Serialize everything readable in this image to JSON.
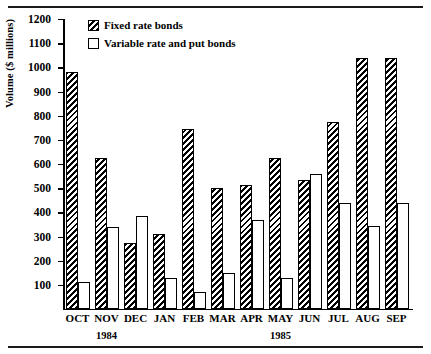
{
  "chart_data": {
    "type": "bar",
    "title": "",
    "xlabel": "",
    "ylabel": "Volume ($ millions)",
    "ylim": [
      0,
      1200
    ],
    "ytick_step": 100,
    "yticks": [
      1200,
      1100,
      1000,
      900,
      800,
      700,
      600,
      500,
      400,
      300,
      200,
      100
    ],
    "categories": [
      "OCT",
      "NOV",
      "DEC",
      "JAN",
      "FEB",
      "MAR",
      "APR",
      "MAY",
      "JUN",
      "JUL",
      "AUG",
      "SEP"
    ],
    "group_annotations": [
      {
        "label": "1984",
        "under_category": "NOV"
      },
      {
        "label": "1985",
        "under_category": "MAY"
      }
    ],
    "series": [
      {
        "name": "Fixed rate bonds",
        "style": "diagonal-hatch",
        "values": [
          980,
          625,
          275,
          310,
          745,
          500,
          515,
          625,
          535,
          775,
          1040,
          1040
        ]
      },
      {
        "name": "Variable rate and put bonds",
        "style": "white-fill",
        "values": [
          110,
          340,
          385,
          130,
          70,
          150,
          370,
          130,
          560,
          440,
          345,
          440
        ]
      }
    ],
    "legend": {
      "position": "top-left-inside",
      "entries": [
        {
          "label": "Fixed rate bonds",
          "swatch": "hatch"
        },
        {
          "label": "Variable rate and put bonds",
          "swatch": "plain"
        }
      ]
    },
    "grid": false,
    "colors": {
      "ink": "#000000",
      "background": "#ffffff"
    }
  }
}
